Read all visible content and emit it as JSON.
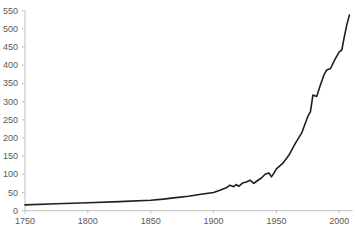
{
  "chart_data": {
    "type": "line",
    "title": "",
    "xlabel": "",
    "ylabel": "",
    "xlim": [
      1750,
      2010
    ],
    "ylim": [
      0,
      550
    ],
    "grid": false,
    "legend": null,
    "x_ticks": [
      1750,
      1800,
      1850,
      1900,
      1950,
      2000
    ],
    "y_ticks": [
      0,
      50,
      100,
      150,
      200,
      250,
      300,
      350,
      400,
      450,
      500,
      550
    ],
    "series": [
      {
        "name": "series-1",
        "color": "#1f1f1f",
        "x": [
          1750,
          1775,
          1800,
          1825,
          1850,
          1860,
          1870,
          1880,
          1890,
          1900,
          1905,
          1910,
          1913,
          1916,
          1918,
          1920,
          1923,
          1926,
          1929,
          1932,
          1935,
          1938,
          1941,
          1944,
          1946,
          1948,
          1950,
          1955,
          1960,
          1965,
          1970,
          1975,
          1977,
          1979,
          1982,
          1985,
          1988,
          1990,
          1993,
          1997,
          2000,
          2002,
          2004,
          2006,
          2008
        ],
        "y": [
          16,
          19,
          22,
          25,
          29,
          32,
          36,
          40,
          45,
          50,
          56,
          63,
          70,
          66,
          72,
          67,
          76,
          79,
          84,
          75,
          83,
          90,
          100,
          104,
          93,
          103,
          115,
          130,
          153,
          185,
          213,
          260,
          272,
          318,
          314,
          346,
          375,
          387,
          391,
          419,
          437,
          442,
          478,
          511,
          538
        ]
      }
    ]
  },
  "layout": {
    "plot_left_px": 25,
    "plot_right_px": 352.7,
    "plot_top_px": 10.7,
    "plot_bottom_px": 210.7,
    "x_axis_label_y_px": 224,
    "y_axis_label_right_px": 18
  },
  "fragments": {
    "title": "",
    "bottom": ""
  }
}
